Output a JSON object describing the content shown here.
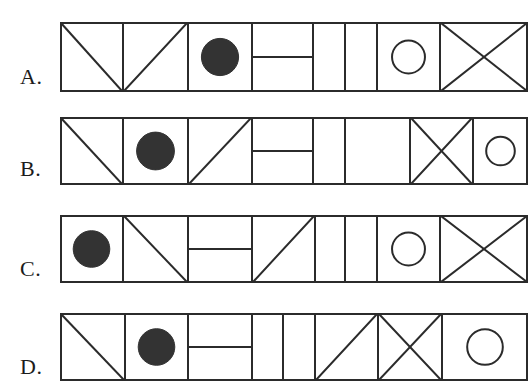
{
  "page": {
    "kind": "multiple-choice-figure-sequence",
    "background_color": "#ffffff",
    "ink_color": "#2b2b2b",
    "fill_color": "#333333",
    "width": 527,
    "height": 381,
    "stroke_width": 2
  },
  "options": [
    {
      "id": "A",
      "label": "A.",
      "label_x": 20,
      "label_y": 64,
      "strip": {
        "x": 60,
        "y": 22,
        "width": 468,
        "height": 70
      },
      "dividers": [
        60,
        123,
        188,
        252,
        313,
        345,
        377,
        440,
        528
      ],
      "cells": [
        {
          "index": 1,
          "glyph": "diagonal-tl-br",
          "glyph_name": "diagonal-top-left-to-bottom-right"
        },
        {
          "index": 2,
          "glyph": "diagonal-tr-bl",
          "glyph_name": "diagonal-top-right-to-bottom-left"
        },
        {
          "index": 3,
          "glyph": "filled-circle",
          "glyph_name": "filled-circle"
        },
        {
          "index": 4,
          "glyph": "horizontal-bar",
          "glyph_name": "horizontal-bar"
        },
        {
          "index": 5,
          "glyph": "blank",
          "glyph_name": "blank-narrow-cell"
        },
        {
          "index": 6,
          "glyph": "blank",
          "glyph_name": "blank-narrow-cell"
        },
        {
          "index": 7,
          "glyph": "open-circle",
          "glyph_name": "open-circle"
        },
        {
          "index": 8,
          "glyph": "cross-x",
          "glyph_name": "crossed-diagonals"
        }
      ]
    },
    {
      "id": "B",
      "label": "B.",
      "label_x": 20,
      "label_y": 156,
      "strip": {
        "x": 60,
        "y": 117,
        "width": 468,
        "height": 68
      },
      "dividers": [
        60,
        123,
        188,
        252,
        313,
        345,
        410,
        473,
        528
      ],
      "cells": [
        {
          "index": 1,
          "glyph": "diagonal-tl-br",
          "glyph_name": "diagonal-top-left-to-bottom-right"
        },
        {
          "index": 2,
          "glyph": "filled-circle",
          "glyph_name": "filled-circle"
        },
        {
          "index": 3,
          "glyph": "diagonal-bl-tr",
          "glyph_name": "diagonal-bottom-left-to-top-right"
        },
        {
          "index": 4,
          "glyph": "horizontal-bar",
          "glyph_name": "horizontal-bar"
        },
        {
          "index": 5,
          "glyph": "blank",
          "glyph_name": "blank-narrow-cell"
        },
        {
          "index": 6,
          "glyph": "blank",
          "glyph_name": "blank-narrow-cell"
        },
        {
          "index": 7,
          "glyph": "cross-x",
          "glyph_name": "crossed-diagonals"
        },
        {
          "index": 8,
          "glyph": "open-circle",
          "glyph_name": "open-circle"
        }
      ]
    },
    {
      "id": "C",
      "label": "C.",
      "label_x": 20,
      "label_y": 256,
      "strip": {
        "x": 60,
        "y": 215,
        "width": 468,
        "height": 68
      },
      "dividers": [
        60,
        123,
        188,
        252,
        315,
        345,
        377,
        440,
        528
      ],
      "cells": [
        {
          "index": 1,
          "glyph": "filled-circle",
          "glyph_name": "filled-circle"
        },
        {
          "index": 2,
          "glyph": "diagonal-tl-br",
          "glyph_name": "diagonal-top-left-to-bottom-right"
        },
        {
          "index": 3,
          "glyph": "horizontal-bar",
          "glyph_name": "horizontal-bar"
        },
        {
          "index": 4,
          "glyph": "diagonal-bl-tr",
          "glyph_name": "diagonal-bottom-left-to-top-right"
        },
        {
          "index": 5,
          "glyph": "blank",
          "glyph_name": "blank-narrow-cell"
        },
        {
          "index": 6,
          "glyph": "blank",
          "glyph_name": "blank-narrow-cell"
        },
        {
          "index": 7,
          "glyph": "open-circle",
          "glyph_name": "open-circle"
        },
        {
          "index": 8,
          "glyph": "cross-x",
          "glyph_name": "crossed-diagonals"
        }
      ]
    },
    {
      "id": "D",
      "label": "D.",
      "label_x": 20,
      "label_y": 354,
      "strip": {
        "x": 60,
        "y": 313,
        "width": 468,
        "height": 68
      },
      "dividers": [
        60,
        125,
        188,
        252,
        283,
        315,
        378,
        442,
        528
      ],
      "clipped_bottom": true,
      "cells": [
        {
          "index": 1,
          "glyph": "diagonal-tl-br",
          "glyph_name": "diagonal-top-left-to-bottom-right"
        },
        {
          "index": 2,
          "glyph": "filled-circle",
          "glyph_name": "filled-circle"
        },
        {
          "index": 3,
          "glyph": "horizontal-bar",
          "glyph_name": "horizontal-bar"
        },
        {
          "index": 4,
          "glyph": "blank",
          "glyph_name": "blank-narrow-cell"
        },
        {
          "index": 5,
          "glyph": "blank",
          "glyph_name": "blank-narrow-cell"
        },
        {
          "index": 6,
          "glyph": "diagonal-bl-tr",
          "glyph_name": "diagonal-bottom-left-to-top-right"
        },
        {
          "index": 7,
          "glyph": "cross-x",
          "glyph_name": "crossed-diagonals"
        },
        {
          "index": 8,
          "glyph": "open-circle",
          "glyph_name": "open-circle"
        }
      ]
    }
  ]
}
